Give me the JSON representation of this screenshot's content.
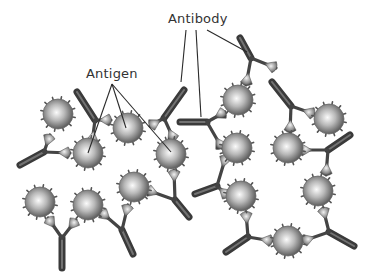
{
  "diagram": {
    "type": "antibody-antigen-complex-illustration",
    "labels": {
      "antibody": "Antibody",
      "antigen": "Antigen"
    },
    "colors": {
      "background": "#ffffff",
      "label_text": "#333333",
      "leader_line": "#2a2a2a",
      "antigen_light": "#f4f4f4",
      "antigen_dark": "#5a5a5a",
      "antibody_dark": "#3a3a3a"
    },
    "antigens": [
      {
        "x": 58,
        "y": 114,
        "r": 15
      },
      {
        "x": 88,
        "y": 153,
        "r": 15
      },
      {
        "x": 128,
        "y": 128,
        "r": 15
      },
      {
        "x": 171,
        "y": 154,
        "r": 15
      },
      {
        "x": 238,
        "y": 100,
        "r": 15
      },
      {
        "x": 329,
        "y": 119,
        "r": 15
      },
      {
        "x": 237,
        "y": 148,
        "r": 15
      },
      {
        "x": 288,
        "y": 148,
        "r": 15
      },
      {
        "x": 40,
        "y": 202,
        "r": 15
      },
      {
        "x": 88,
        "y": 205,
        "r": 15
      },
      {
        "x": 134,
        "y": 187,
        "r": 15
      },
      {
        "x": 241,
        "y": 196,
        "r": 15
      },
      {
        "x": 318,
        "y": 191,
        "r": 15
      },
      {
        "x": 288,
        "y": 241,
        "r": 15
      }
    ],
    "antibodies": [
      {
        "stem": [
          [
            77,
            92
          ],
          [
            95,
            120
          ]
        ],
        "armL": [
          111,
          120
        ],
        "armR": [
          92,
          143
        ]
      },
      {
        "stem": [
          [
            184,
            90
          ],
          [
            164,
            118
          ]
        ],
        "armL": [
          150,
          126
        ],
        "armR": [
          174,
          140
        ]
      },
      {
        "stem": [
          [
            20,
            165
          ],
          [
            44,
            152
          ]
        ],
        "armL": [
          50,
          135
        ],
        "armR": [
          70,
          153
        ]
      },
      {
        "stem": [
          [
            180,
            122
          ],
          [
            207,
            122
          ]
        ],
        "armL": [
          225,
          112
        ],
        "armR": [
          222,
          148
        ]
      },
      {
        "stem": [
          [
            240,
            38
          ],
          [
            251,
            58
          ]
        ],
        "armL": [
          246,
          85
        ],
        "armR": [
          276,
          68
        ]
      },
      {
        "stem": [
          [
            272,
            82
          ],
          [
            291,
            106
          ]
        ],
        "armL": [
          290,
          132
        ],
        "armR": [
          314,
          114
        ]
      },
      {
        "stem": [
          [
            350,
            135
          ],
          [
            328,
            150
          ]
        ],
        "armL": [
          300,
          150
        ],
        "armR": [
          326,
          175
        ]
      },
      {
        "stem": [
          [
            195,
            194
          ],
          [
            217,
            186
          ]
        ],
        "armL": [
          226,
          156
        ],
        "armR": [
          228,
          196
        ]
      },
      {
        "stem": [
          [
            62,
            268
          ],
          [
            62,
            238
          ]
        ],
        "armL": [
          48,
          218
        ],
        "armR": [
          76,
          220
        ]
      },
      {
        "stem": [
          [
            133,
            254
          ],
          [
            122,
            230
          ]
        ],
        "armL": [
          101,
          212
        ],
        "armR": [
          128,
          205
        ]
      },
      {
        "stem": [
          [
            189,
            217
          ],
          [
            175,
            200
          ]
        ],
        "armL": [
          147,
          190
        ],
        "armR": [
          174,
          170
        ]
      },
      {
        "stem": [
          [
            226,
            252
          ],
          [
            248,
            237
          ]
        ],
        "armL": [
          246,
          212
        ],
        "armR": [
          272,
          241
        ]
      },
      {
        "stem": [
          [
            354,
            246
          ],
          [
            329,
            232
          ]
        ],
        "armL": [
          303,
          241
        ],
        "armR": [
          323,
          208
        ]
      }
    ],
    "leader_lines": {
      "antibody": [
        {
          "from": [
            186,
            30
          ],
          "to": [
            181,
            82
          ]
        },
        {
          "from": [
            196,
            30
          ],
          "to": [
            201,
            117
          ]
        },
        {
          "from": [
            207,
            30
          ],
          "to": [
            247,
            52
          ]
        }
      ],
      "antigen": [
        {
          "from": [
            112,
            84
          ],
          "to": [
            88,
            153
          ]
        },
        {
          "from": [
            112,
            84
          ],
          "to": [
            126,
            128
          ]
        },
        {
          "from": [
            112,
            84
          ],
          "to": [
            171,
            152
          ]
        }
      ]
    }
  }
}
